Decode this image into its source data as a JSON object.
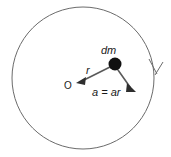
{
  "figure": {
    "background_color": "#ffffff",
    "circle_stroke_color": "#6b6b6b",
    "vector_stroke_color": "#5a5a5a",
    "mass_dot_color": "#111111",
    "label_color": "#1a1a1a"
  },
  "labels": {
    "mass_element": "dm",
    "radius_vector": "r",
    "origin": "O",
    "acceleration": "a = ar"
  },
  "icons": {
    "radius_arrowhead": "arrowhead-icon",
    "acceleration_arrowhead": "arrowhead-icon",
    "rotation_direction_arrowhead": "arrowhead-icon"
  },
  "geometry": {
    "circle_center_x": 83,
    "circle_center_y": 78,
    "circle_radius": 71,
    "origin_point_x": 78,
    "origin_point_y": 82,
    "mass_point_x": 115,
    "mass_point_y": 64,
    "mass_dot_radius": 6,
    "acceleration_tip_x": 134,
    "acceleration_tip_y": 90,
    "rotation_marker_x": 155,
    "rotation_marker_y": 72
  }
}
